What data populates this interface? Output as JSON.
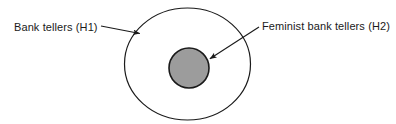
{
  "figure": {
    "type": "euler-diagram",
    "background_color": "#ffffff",
    "labels": {
      "outer_set": "Bank tellers (H1)",
      "inner_set": "Feminist bank tellers (H2)"
    },
    "shapes": {
      "outer_ellipse": {
        "name": "Bank tellers (H1)",
        "center_x": 187.5,
        "center_y": 64,
        "radius_x": 63,
        "radius_y": 56,
        "fill_color": "#ffffff",
        "stroke_color": "#1a1a1a",
        "stroke_width": 1.2
      },
      "inner_circle": {
        "name": "Feminist bank tellers (H2)",
        "center_x": 189,
        "center_y": 68,
        "radius_x": 20,
        "radius_y": 20,
        "fill_color": "#9c9c9c",
        "stroke_color": "#1a1a1a",
        "stroke_width": 1.6
      }
    },
    "arrows": [
      {
        "name": "arrow-to-outer-ellipse",
        "from_x": 101,
        "from_y": 26,
        "to_x": 142,
        "to_y": 34,
        "stroke_color": "#1a1a1a"
      },
      {
        "name": "arrow-to-inner-circle",
        "from_x": 259,
        "from_y": 27,
        "to_x": 208,
        "to_y": 60,
        "stroke_color": "#1a1a1a"
      }
    ]
  }
}
